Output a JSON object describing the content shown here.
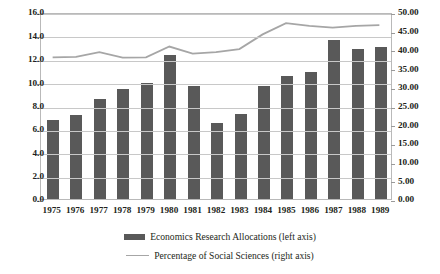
{
  "chart_data": {
    "type": "bar",
    "title": "",
    "subtitle": "",
    "xlabel": "",
    "ylabel": "",
    "grid": true,
    "legend_position": "bottom",
    "categories": [
      "1975",
      "1976",
      "1977",
      "1978",
      "1979",
      "1980",
      "1981",
      "1982",
      "1983",
      "1984",
      "1985",
      "1986",
      "1987",
      "1988",
      "1989"
    ],
    "series": [
      {
        "name": "Economics Research Allocations (left axis)",
        "type": "bar",
        "axis": "left",
        "color": "#595959",
        "values": [
          6.8,
          7.2,
          8.6,
          9.4,
          9.9,
          12.3,
          9.7,
          6.5,
          7.3,
          9.7,
          10.5,
          10.9,
          13.6,
          12.8,
          13.0
        ]
      },
      {
        "name": "Percentage of Social Sciences (right axis)",
        "type": "line",
        "axis": "right",
        "color": "#a6a6a6",
        "values": [
          38.3,
          38.4,
          39.7,
          38.2,
          38.3,
          41.2,
          39.3,
          39.7,
          40.5,
          44.5,
          47.5,
          46.8,
          46.3,
          46.8,
          47.0
        ]
      }
    ],
    "left_axis": {
      "min": 0.0,
      "max": 16.0,
      "step": 2.0,
      "ticks": [
        "0.0",
        "2.0",
        "4.0",
        "6.0",
        "8.0",
        "10.0",
        "12.0",
        "14.0",
        "16.0"
      ]
    },
    "right_axis": {
      "min": 0.0,
      "max": 50.0,
      "step": 5.0,
      "ticks": [
        "0.00",
        "5.00",
        "10.00",
        "15.00",
        "20.00",
        "25.00",
        "30.00",
        "35.00",
        "40.00",
        "45.00",
        "50.00"
      ]
    }
  },
  "legend": {
    "items": [
      {
        "label": "Economics Research Allocations (left axis)",
        "marker": "bar-swatch-icon"
      },
      {
        "label": "Percentage of Social Sciences (right axis)",
        "marker": "line-swatch-icon"
      }
    ]
  },
  "colors": {
    "bar": "#595959",
    "line": "#a6a6a6",
    "grid": "#c8c8c8",
    "frame": "#b9b9b9",
    "text": "#231f20",
    "background": "#ffffff"
  }
}
